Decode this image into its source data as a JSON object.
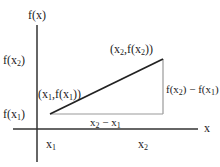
{
  "diagram": {
    "axes": {
      "y_label": "f(x)",
      "x_label": "x"
    },
    "tick_labels": {
      "y_upper": {
        "pre": "f(x",
        "sub": "2",
        "post": ")"
      },
      "y_lower": {
        "pre": "f(x",
        "sub": "1",
        "post": ")"
      },
      "x_left": {
        "pre": "x",
        "sub": "1",
        "post": ""
      },
      "x_right": {
        "pre": "x",
        "sub": "2",
        "post": ""
      }
    },
    "points": {
      "p1": {
        "a": "(x",
        "s1": "1",
        "b": ",f(x",
        "s2": "1",
        "c": "))"
      },
      "p2": {
        "a": "(x",
        "s1": "2",
        "b": ",f(x",
        "s2": "2",
        "c": "))"
      }
    },
    "differences": {
      "dy": {
        "a": "f(x",
        "s1": "2",
        "b": ") − f(x",
        "s2": "1",
        "c": ")"
      },
      "dx": {
        "a": "x",
        "s1": "2",
        "b": " − x",
        "s2": "1",
        "c": ""
      }
    },
    "colors": {
      "axis": "#333333",
      "hypotenuse": "#222222",
      "legs": "#999999",
      "text": "#222222"
    }
  }
}
